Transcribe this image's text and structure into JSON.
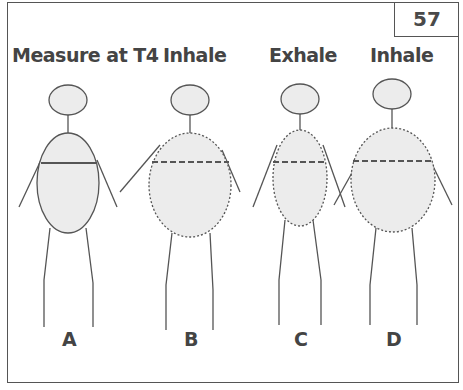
{
  "figure_number": "57",
  "panels": [
    {
      "id": "A",
      "title": "Measure at T4",
      "label": "A",
      "line_style": "solid"
    },
    {
      "id": "B",
      "title": "Inhale",
      "label": "B",
      "line_style": "dashed"
    },
    {
      "id": "C",
      "title": "Exhale",
      "label": "C",
      "line_style": "dashed"
    },
    {
      "id": "D",
      "title": "Inhale",
      "label": "D",
      "line_style": "dashed"
    }
  ],
  "colors": {
    "stroke": "#555555",
    "fill": "#ececec",
    "text": "#444444"
  }
}
